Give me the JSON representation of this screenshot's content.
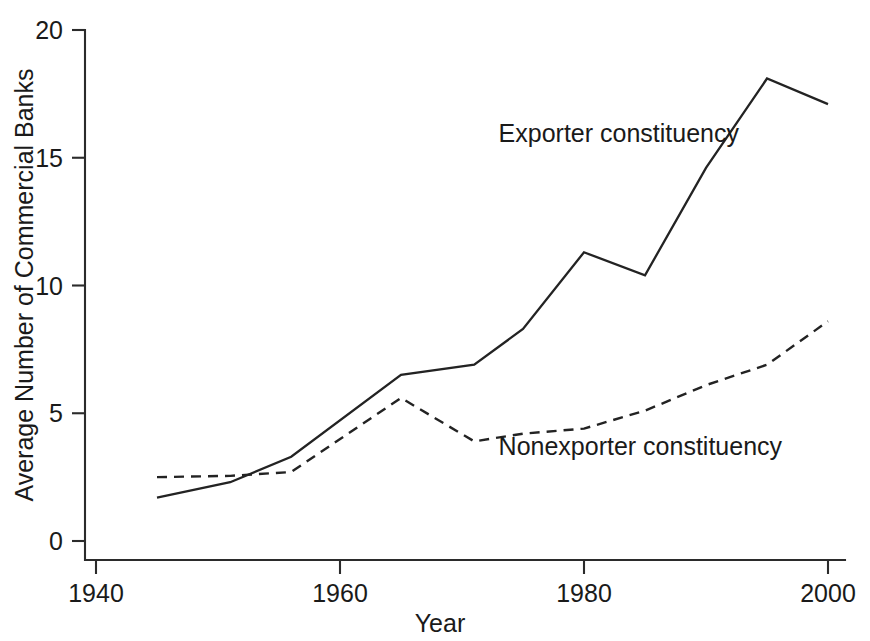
{
  "chart_data": {
    "type": "line",
    "title": "",
    "xlabel": "Year",
    "ylabel": "Average Number of Commercial Banks",
    "xlim": [
      1940,
      2001
    ],
    "ylim": [
      0,
      20
    ],
    "xticks": [
      1940,
      1960,
      1980,
      2000
    ],
    "xticklabels": [
      "1940",
      "1960",
      "1980",
      "2000"
    ],
    "yticks": [
      0,
      5,
      10,
      15,
      20
    ],
    "yticklabels": [
      "0",
      "5",
      "10",
      "15",
      "20"
    ],
    "grid": false,
    "legend_position": "inline-annotation",
    "series": [
      {
        "name": "Exporter constituency",
        "style": "solid",
        "color": "#232323",
        "x": [
          1945,
          1951,
          1956,
          1965,
          1971,
          1975,
          1980,
          1985,
          1990,
          1995,
          2000
        ],
        "values": [
          1.7,
          2.3,
          3.3,
          6.5,
          6.9,
          8.3,
          11.3,
          10.4,
          14.6,
          18.1,
          17.1
        ],
        "annotation": {
          "text": "Exporter constituency",
          "x": 1973.0,
          "y": 15.6
        }
      },
      {
        "name": "Nonexporter constituency",
        "style": "dashed",
        "color": "#232323",
        "x": [
          1945,
          1951,
          1956,
          1965,
          1971,
          1975,
          1980,
          1985,
          1990,
          1995,
          2000
        ],
        "values": [
          2.5,
          2.55,
          2.7,
          5.6,
          3.9,
          4.2,
          4.4,
          5.1,
          6.1,
          6.9,
          8.6
        ],
        "annotation": {
          "text": "Nonexporter constituency",
          "x": 1973.0,
          "y": 3.35
        }
      }
    ]
  },
  "axis_titles": {
    "x": "Year",
    "y": "Average Number of Commercial Banks"
  }
}
